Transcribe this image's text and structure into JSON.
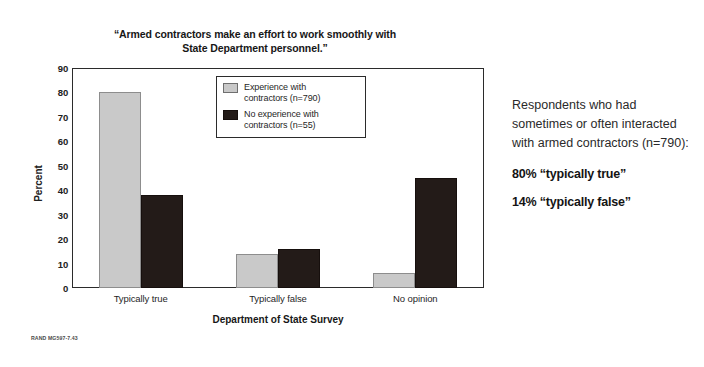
{
  "chart_data": {
    "type": "bar",
    "title": "“Armed contractors make an effort to work smoothly with State Department personnel.”",
    "title_line1": "“Armed contractors make an effort to work smoothly with",
    "title_line2": "State Department personnel.”",
    "xlabel": "Department of State Survey",
    "ylabel": "Percent",
    "ylim": [
      0,
      90
    ],
    "yticks": [
      90,
      80,
      70,
      60,
      50,
      40,
      30,
      20,
      10,
      0
    ],
    "grid": false,
    "legend_position": "inside-top-center",
    "categories": [
      "Typically true",
      "Typically false",
      "No opinion"
    ],
    "series": [
      {
        "name": "Experience with contractors (n=790)",
        "name_line1": "Experience with",
        "name_line2": "contractors (n=790)",
        "color": "#c9c9c9",
        "values": [
          80,
          14,
          6
        ]
      },
      {
        "name": "No experience with contractors (n=55)",
        "name_line1": "No experience with",
        "name_line2": "contractors (n=55)",
        "color": "#231b18",
        "values": [
          38,
          16,
          45
        ]
      }
    ]
  },
  "figure": {
    "source_id": "RAND MG597-7.43"
  },
  "side_note": {
    "body": "Respondents who had sometimes or often interacted with armed contractors (n=790):",
    "stat_true": "80% “typically true”",
    "stat_false": "14% “typically false”"
  }
}
